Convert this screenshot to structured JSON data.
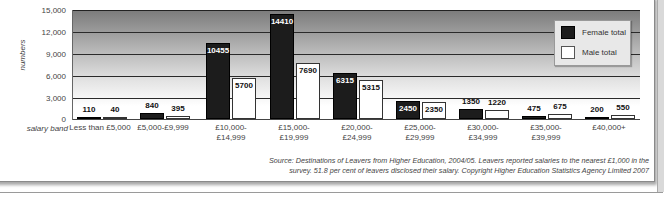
{
  "chart_data": {
    "type": "bar",
    "title": "",
    "xlabel": "salary band",
    "ylabel": "numbers",
    "ylim": [
      0,
      15000
    ],
    "yticks": [
      "15,000",
      "12,000",
      "9,000",
      "6,000",
      "3,000",
      "0"
    ],
    "grid": true,
    "legend_position": "top-right",
    "categories": [
      "Less than £5,000",
      "£5,000-£9,999",
      "£10,000-\n£14,999",
      "£15,000-\n£19,999",
      "£20,000-\n£24,999",
      "£25,000-\n£29,999",
      "£30,000-\n£34,999",
      "£35,000-\n£39,999",
      "£40,000+"
    ],
    "series": [
      {
        "name": "Female total",
        "color": "#1c1c1c",
        "values": [
          110,
          840,
          10455,
          14410,
          6315,
          2450,
          1350,
          475,
          200
        ]
      },
      {
        "name": "Male total",
        "color": "#ffffff",
        "values": [
          40,
          395,
          5700,
          7690,
          5315,
          2350,
          1220,
          675,
          550
        ]
      }
    ]
  },
  "axis": {
    "y_title": "numbers",
    "x_title": "salary band",
    "ticks": [
      "15,000",
      "12,000",
      "9,000",
      "6,000",
      "3,000",
      "0"
    ]
  },
  "categories": {
    "c0": {
      "l1": "Less than £5,000",
      "l2": ""
    },
    "c1": {
      "l1": "£5,000-£9,999",
      "l2": ""
    },
    "c2": {
      "l1": "£10,000-",
      "l2": "£14,999"
    },
    "c3": {
      "l1": "£15,000-",
      "l2": "£19,999"
    },
    "c4": {
      "l1": "£20,000-",
      "l2": "£24,999"
    },
    "c5": {
      "l1": "£25,000-",
      "l2": "£29,999"
    },
    "c6": {
      "l1": "£30,000-",
      "l2": "£34,999"
    },
    "c7": {
      "l1": "£35,000-",
      "l2": "£39,999"
    },
    "c8": {
      "l1": "£40,000+",
      "l2": ""
    }
  },
  "values": {
    "female": [
      "110",
      "840",
      "10455",
      "14410",
      "6315",
      "2450",
      "1350",
      "475",
      "200"
    ],
    "male": [
      "40",
      "395",
      "5700",
      "7690",
      "5315",
      "2350",
      "1220",
      "675",
      "550"
    ]
  },
  "legend": {
    "female": "Female total",
    "male": "Male total"
  },
  "source": {
    "line1": "Source: Destinations of Leavers from Higher Education, 2004/05. Leavers reported salaries to the nearest £1,000 in the",
    "line2": "survey. 51.8 per cent of leavers disclosed their salary. Copyright Higher Education Statistics Agency Limited 2007"
  }
}
